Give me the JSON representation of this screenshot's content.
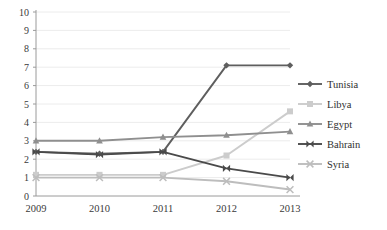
{
  "chart_data": {
    "type": "line",
    "title": "",
    "xlabel": "",
    "ylabel": "",
    "categories": [
      "2009",
      "2010",
      "2011",
      "2012",
      "2013"
    ],
    "x": [
      2009,
      2010,
      2011,
      2012,
      2013
    ],
    "ylim": [
      0,
      10
    ],
    "y_ticks": [
      "0",
      "1",
      "2",
      "3",
      "4",
      "5",
      "6",
      "7",
      "8",
      "9",
      "10"
    ],
    "grid": true,
    "legend_position": "right",
    "series": [
      {
        "name": "Tunisia",
        "marker": "diamond",
        "color": "#5e5e5e",
        "values": [
          2.4,
          2.3,
          2.4,
          7.1,
          7.1
        ]
      },
      {
        "name": "Libya",
        "marker": "square",
        "color": "#cccccc",
        "values": [
          1.15,
          1.15,
          1.15,
          2.2,
          4.6
        ]
      },
      {
        "name": "Egypt",
        "marker": "triangle",
        "color": "#8f8f8f",
        "values": [
          3.0,
          3.0,
          3.2,
          3.3,
          3.5
        ]
      },
      {
        "name": "Bahrain",
        "marker": "bowtie",
        "color": "#4a4a4a",
        "values": [
          2.4,
          2.25,
          2.4,
          1.5,
          1.0
        ]
      },
      {
        "name": "Syria",
        "marker": "x",
        "color": "#bdbdbd",
        "values": [
          1.0,
          1.0,
          1.0,
          0.8,
          0.35
        ]
      }
    ]
  },
  "legend": {
    "items": [
      {
        "label": "Tunisia"
      },
      {
        "label": "Libya"
      },
      {
        "label": "Egypt"
      },
      {
        "label": "Bahrain"
      },
      {
        "label": "Syria"
      }
    ]
  }
}
